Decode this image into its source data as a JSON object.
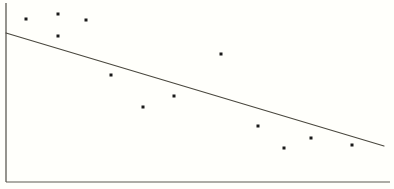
{
  "figure": {
    "width": 394,
    "height": 189,
    "background_color": "#fffffb",
    "title": "",
    "caption": ""
  },
  "chart_data": {
    "type": "scatter",
    "title": "",
    "subtitle": "",
    "xlabel": "",
    "ylabel": "",
    "xlim": [
      0,
      394
    ],
    "ylim": [
      0,
      182
    ],
    "grid": false,
    "legend": false,
    "legend_position": "none",
    "axis": {
      "style": "left-and-bottom-spines",
      "color": "#5c5a52",
      "x_ticks": [],
      "y_ticks": [],
      "x_tick_labels": [],
      "y_tick_labels": [],
      "left_spine": {
        "x": 6,
        "y_top": 3,
        "y_bottom": 182
      },
      "bottom_spine": {
        "y": 182,
        "x_left": 6,
        "x_right": 390
      }
    },
    "points": [
      {
        "x": 26,
        "y": 19
      },
      {
        "x": 58,
        "y": 14
      },
      {
        "x": 58,
        "y": 36
      },
      {
        "x": 86,
        "y": 20
      },
      {
        "x": 111,
        "y": 75
      },
      {
        "x": 143,
        "y": 107
      },
      {
        "x": 174,
        "y": 96
      },
      {
        "x": 221,
        "y": 54
      },
      {
        "x": 258,
        "y": 126
      },
      {
        "x": 284,
        "y": 148
      },
      {
        "x": 311,
        "y": 138
      },
      {
        "x": 352,
        "y": 145
      }
    ],
    "point_marker": {
      "shape": "square",
      "size_px": 3,
      "color": "#1a1a1a"
    },
    "trend_line": {
      "label": "regression line",
      "color": "#4a483f",
      "width_px": 1.15,
      "x1": 6,
      "y1": 33,
      "x2": 384,
      "y2": 146,
      "slope": -0.299,
      "intercept": 34.8
    }
  }
}
